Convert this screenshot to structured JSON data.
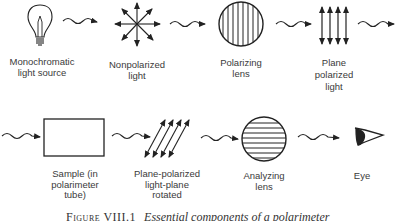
{
  "figure": {
    "caption_label": "Figure VIII.1",
    "caption_text": "Essential components of a polarimeter",
    "row1": [
      {
        "id": "light-source",
        "icon": "light-bulb-icon",
        "lines": [
          "Monochromatic",
          "light source"
        ]
      },
      {
        "id": "nonpolarized-light",
        "icon": "nonpolarized-star-icon",
        "lines": [
          "Nonpolarized",
          "light"
        ]
      },
      {
        "id": "polarizing-lens",
        "icon": "vertical-lined-lens-icon",
        "lines": [
          "Polarizing",
          "lens"
        ]
      },
      {
        "id": "plane-polarized-light",
        "icon": "vertical-arrows-icon",
        "lines": [
          "Plane",
          "polarized",
          "light"
        ]
      }
    ],
    "row2": [
      {
        "id": "sample",
        "icon": "rectangle-sample-tube-icon",
        "lines": [
          "Sample (in",
          "polarimeter",
          "tube)"
        ]
      },
      {
        "id": "rotated-light",
        "icon": "diagonal-arrows-icon",
        "lines": [
          "Plane-polarized",
          "light-plane",
          "rotated"
        ]
      },
      {
        "id": "analyzing-lens",
        "icon": "horizontal-lined-lens-icon",
        "lines": [
          "Analyzing",
          "lens"
        ]
      },
      {
        "id": "eye",
        "icon": "eye-icon",
        "lines": [
          "Eye"
        ]
      }
    ]
  }
}
